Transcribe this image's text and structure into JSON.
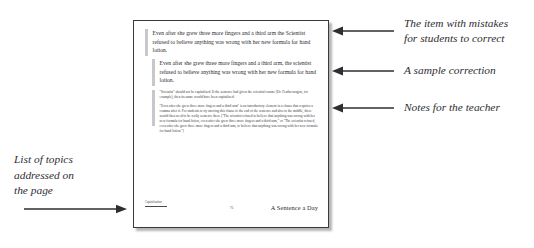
{
  "figure": {
    "kind": "annotated-worksheet-page"
  },
  "page": {
    "blocks": {
      "item_with_mistakes": "Even after she grew three more fingers and a third arm the Scientist refused to believe anything was wrong with her new formula for hand lotion.",
      "sample_correction": "Even after she grew three more fingers and a third arm, the scientist refused to believe anything was wrong with her new formula for hand lotion.",
      "teacher_notes": [
        "\"Scientist\" should not be capitalized. If the sentence had given the scientist's name (Dr. Featherwagon, for example), then its name would have been capitalized.",
        "\"Even after she grew three more fingers and a third arm\" is an introductory element in a clause that requires a comma after it. For students to try moving this clause to the end of the sentence and also to the middle, there would then need to be really sentence there (\"The scientist refused to believe that anything was wrong with her new formula for hand lotion, even after she grew three more fingers and a third arm,\" or \"The scientist refused, even after she grew three more fingers and a third arm, to believe that anything was wrong with her new formula for hand lotion.\")"
      ]
    },
    "footer": {
      "topics_label": "Capitalization",
      "page_number": "76",
      "series_title": "A Sentence a Day"
    }
  },
  "annotations": {
    "item_with_mistakes": "The item with mistakes\nfor students to correct",
    "sample_correction": "A sample correction",
    "teacher_notes": "Notes for the teacher",
    "list_of_topics": "List of topics\naddressed on\nthe page"
  },
  "colors": {
    "page_border": "#3a3a3c",
    "marker_bar": "#c8c8cc",
    "text": "#2b2b2f",
    "annotation_text": "#2e2e32",
    "background": "#ffffff"
  }
}
